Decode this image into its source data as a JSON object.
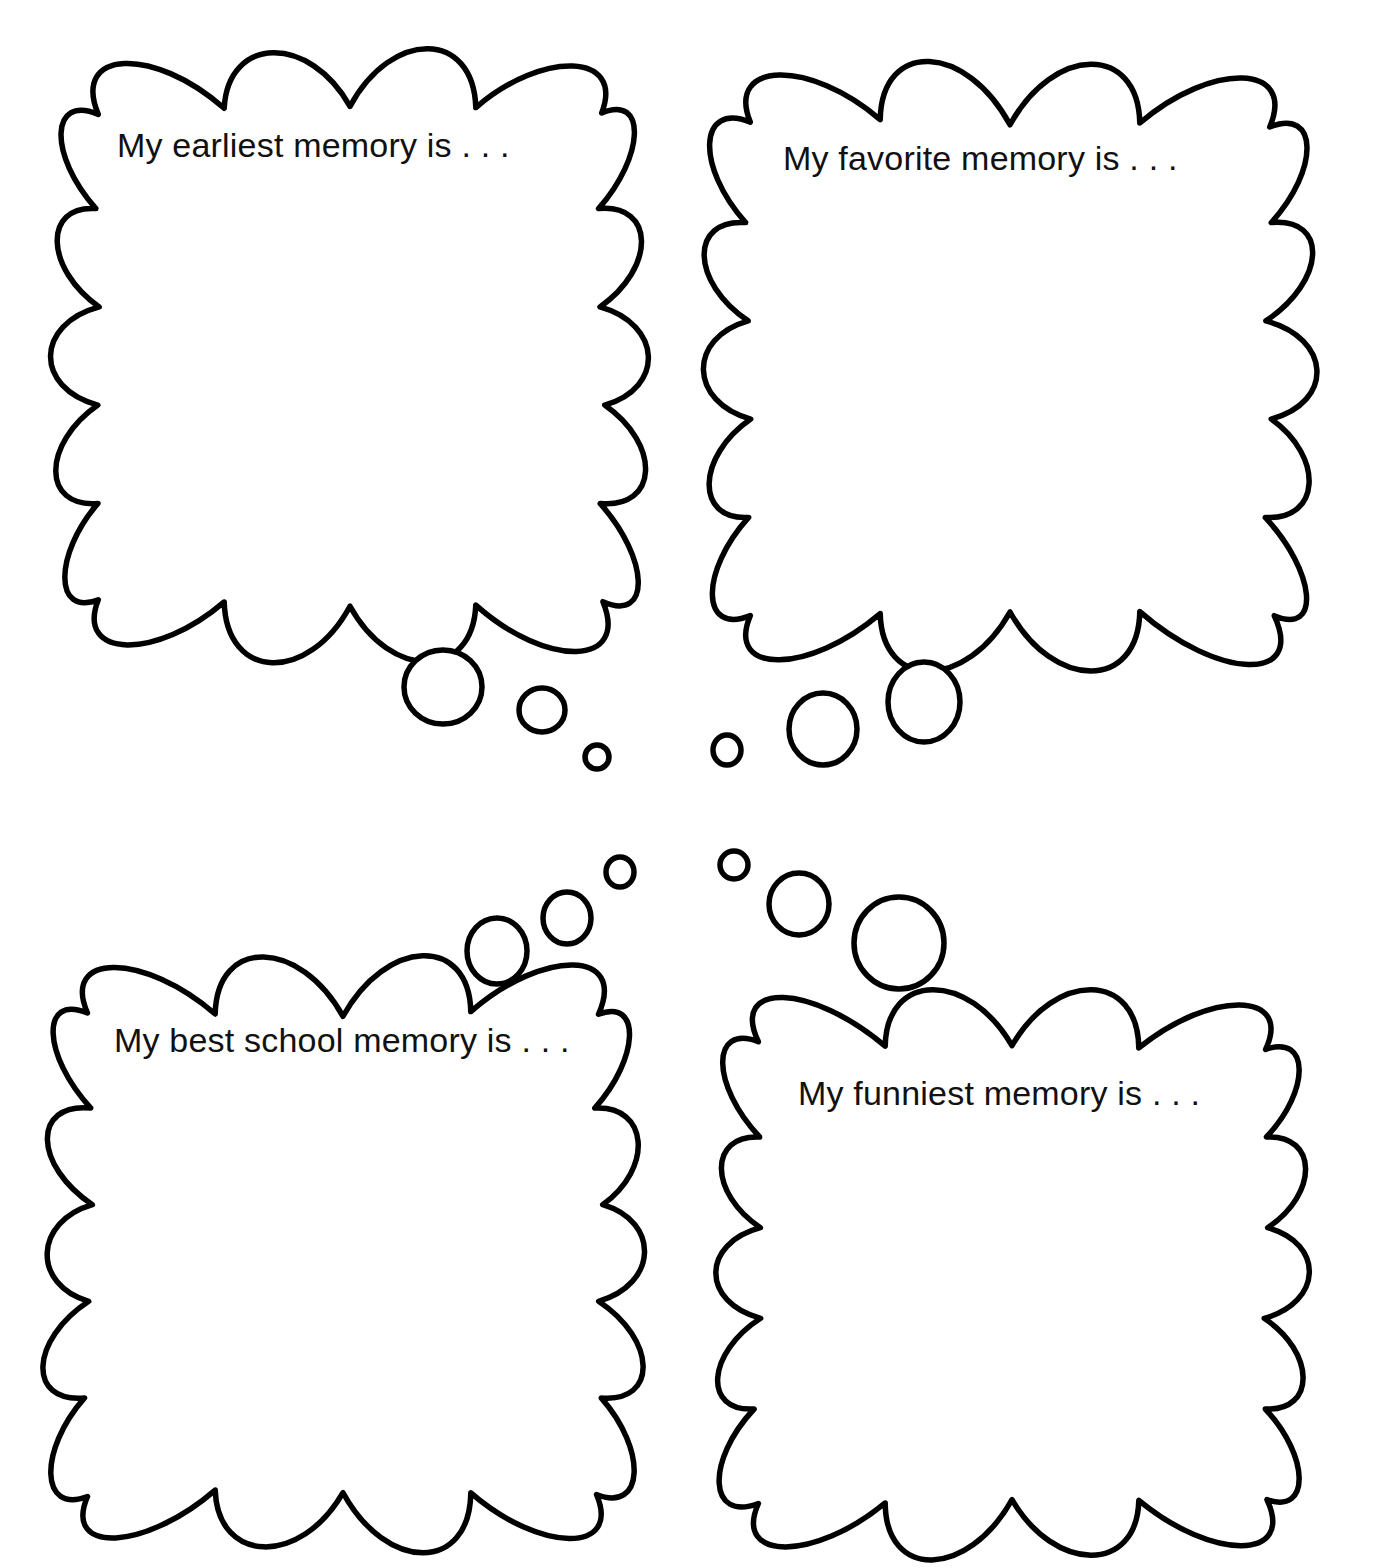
{
  "page": {
    "background_color": "#ffffff",
    "ink_color": "#000000",
    "width": 1383,
    "height": 1568
  },
  "bubbles": [
    {
      "id": "earliest-memory",
      "prompt": "My earliest memory is . . .",
      "text_x": 117,
      "text_y": 157,
      "cloud": {
        "x": 48,
        "y": 60,
        "w": 604,
        "h": 592,
        "bumps_top": 4,
        "bumps_side": 5,
        "bumps_bottom": 4,
        "seed": 11
      }
    },
    {
      "id": "favorite-memory",
      "prompt": "My favorite memory is . . .",
      "text_x": 783,
      "text_y": 170,
      "cloud": {
        "x": 700,
        "y": 74,
        "w": 620,
        "h": 592,
        "bumps_top": 4,
        "bumps_side": 5,
        "bumps_bottom": 4,
        "seed": 27
      }
    },
    {
      "id": "best-school-memory",
      "prompt": "My best school memory is . . .",
      "text_x": 114,
      "text_y": 1052,
      "cloud": {
        "x": 38,
        "y": 962,
        "w": 610,
        "h": 582,
        "bumps_top": 4,
        "bumps_side": 5,
        "bumps_bottom": 4,
        "seed": 43
      }
    },
    {
      "id": "funniest-memory",
      "prompt": "My funniest memory is . . .",
      "text_x": 798,
      "text_y": 1105,
      "cloud": {
        "x": 712,
        "y": 1000,
        "w": 600,
        "h": 546,
        "bumps_top": 4,
        "bumps_side": 5,
        "bumps_bottom": 4,
        "seed": 59
      }
    }
  ],
  "tail_bubbles": [
    {
      "id": "tail-earliest-1",
      "group": "earliest-memory",
      "cx": 443,
      "cy": 687,
      "rx": 39,
      "ry": 37
    },
    {
      "id": "tail-earliest-2",
      "group": "earliest-memory",
      "cx": 542,
      "cy": 710,
      "rx": 23,
      "ry": 22
    },
    {
      "id": "tail-earliest-3",
      "group": "earliest-memory",
      "cx": 597,
      "cy": 757,
      "rx": 12,
      "ry": 12
    },
    {
      "id": "tail-favorite-1",
      "group": "favorite-memory",
      "cx": 924,
      "cy": 702,
      "rx": 36,
      "ry": 40
    },
    {
      "id": "tail-favorite-2",
      "group": "favorite-memory",
      "cx": 823,
      "cy": 729,
      "rx": 34,
      "ry": 36
    },
    {
      "id": "tail-favorite-3",
      "group": "favorite-memory",
      "cx": 727,
      "cy": 750,
      "rx": 14,
      "ry": 15
    },
    {
      "id": "tail-school-1",
      "group": "best-school-memory",
      "cx": 497,
      "cy": 951,
      "rx": 30,
      "ry": 33
    },
    {
      "id": "tail-school-2",
      "group": "best-school-memory",
      "cx": 567,
      "cy": 918,
      "rx": 24,
      "ry": 26
    },
    {
      "id": "tail-school-3",
      "group": "best-school-memory",
      "cx": 620,
      "cy": 872,
      "rx": 14,
      "ry": 15
    },
    {
      "id": "tail-funniest-1",
      "group": "funniest-memory",
      "cx": 899,
      "cy": 943,
      "rx": 45,
      "ry": 46
    },
    {
      "id": "tail-funniest-2",
      "group": "funniest-memory",
      "cx": 799,
      "cy": 904,
      "rx": 30,
      "ry": 31
    },
    {
      "id": "tail-funniest-3",
      "group": "funniest-memory",
      "cx": 734,
      "cy": 865,
      "rx": 14,
      "ry": 14
    }
  ]
}
